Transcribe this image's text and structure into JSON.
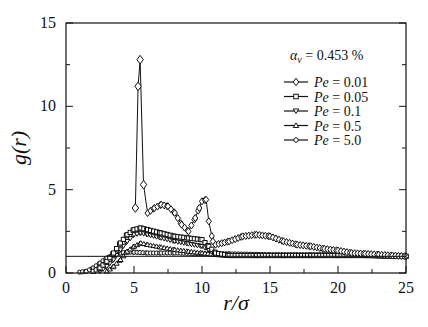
{
  "chart_data": {
    "type": "line",
    "title": "",
    "xlabel": "r/σ",
    "ylabel": "g(r)",
    "xlim": [
      0,
      25
    ],
    "ylim": [
      0,
      15
    ],
    "xticks": [
      0,
      5,
      10,
      15,
      20,
      25
    ],
    "yticks": [
      0,
      5,
      10,
      15
    ],
    "grid": false,
    "reference_line": {
      "y": 1.0
    },
    "annotation": "α_v = 0.453 %",
    "legend_position": "upper right",
    "series": [
      {
        "name": "Pe = 0.01",
        "marker": "diamond",
        "x": [
          5.1,
          5.3,
          5.45,
          5.7,
          6.0,
          6.5,
          7.0,
          7.5,
          8.0,
          8.5,
          9.0,
          9.5,
          9.8,
          10.0,
          10.3,
          10.5,
          10.8,
          11.0,
          12.0,
          13.0,
          14.0,
          15.0,
          16.0,
          17.0,
          18.0,
          19.0,
          20.0,
          21.0,
          22.0,
          23.0,
          24.0,
          25.0
        ],
        "y": [
          3.9,
          11.2,
          12.8,
          5.3,
          3.6,
          3.9,
          4.1,
          4.0,
          3.6,
          2.9,
          2.5,
          3.3,
          3.9,
          4.3,
          4.4,
          3.1,
          1.9,
          1.7,
          1.9,
          2.2,
          2.3,
          2.2,
          1.9,
          1.7,
          1.6,
          1.45,
          1.35,
          1.2,
          1.15,
          1.1,
          1.05,
          1.0
        ]
      },
      {
        "name": "Pe = 0.05",
        "marker": "square",
        "x": [
          2.0,
          2.5,
          3.0,
          3.5,
          4.0,
          4.5,
          5.0,
          5.5,
          6.0,
          7.0,
          8.0,
          9.0,
          10.0,
          10.5,
          11.0,
          12.0,
          14.0,
          16.0,
          18.0,
          20.0,
          22.0,
          25.0
        ],
        "y": [
          0.1,
          0.3,
          0.7,
          1.2,
          1.8,
          2.3,
          2.6,
          2.7,
          2.6,
          2.4,
          2.2,
          2.1,
          2.0,
          1.6,
          1.2,
          1.05,
          1.05,
          1.05,
          1.05,
          1.05,
          1.05,
          1.0
        ]
      },
      {
        "name": "Pe = 0.1",
        "marker": "triangle-down",
        "x": [
          2.5,
          3.0,
          3.5,
          4.0,
          4.5,
          5.0,
          5.5,
          6.0,
          7.0,
          8.0,
          9.0,
          10.0,
          10.5,
          11.0,
          12.0,
          14.0,
          16.0,
          18.0,
          20.0,
          22.0,
          25.0
        ],
        "y": [
          0.1,
          0.4,
          0.8,
          1.4,
          1.9,
          2.3,
          2.4,
          2.3,
          2.1,
          1.9,
          1.75,
          1.6,
          1.4,
          1.1,
          1.05,
          1.05,
          1.05,
          1.05,
          1.05,
          1.05,
          1.0
        ]
      },
      {
        "name": "Pe = 0.5",
        "marker": "triangle-up",
        "x": [
          3.0,
          3.5,
          4.0,
          4.5,
          5.0,
          5.5,
          6.0,
          7.0,
          8.0,
          9.0,
          10.0,
          11.0,
          12.0,
          14.0,
          16.0,
          18.0,
          20.0,
          22.0,
          25.0
        ],
        "y": [
          0.1,
          0.4,
          0.8,
          1.3,
          1.6,
          1.8,
          1.7,
          1.55,
          1.4,
          1.3,
          1.2,
          1.1,
          1.05,
          1.05,
          1.05,
          1.05,
          1.05,
          1.05,
          1.0
        ]
      },
      {
        "name": "Pe = 5.0",
        "marker": "circle",
        "x": [
          1.0,
          1.5,
          2.0,
          2.5,
          3.0,
          3.5,
          4.0,
          4.5,
          5.0,
          6.0,
          7.0,
          8.0,
          10.0,
          12.0,
          15.0,
          18.0,
          20.0,
          22.0,
          25.0
        ],
        "y": [
          0.05,
          0.1,
          0.3,
          0.6,
          0.9,
          1.1,
          1.2,
          1.25,
          1.25,
          1.2,
          1.2,
          1.2,
          1.15,
          1.15,
          1.1,
          1.1,
          1.1,
          1.05,
          1.0
        ]
      }
    ]
  }
}
